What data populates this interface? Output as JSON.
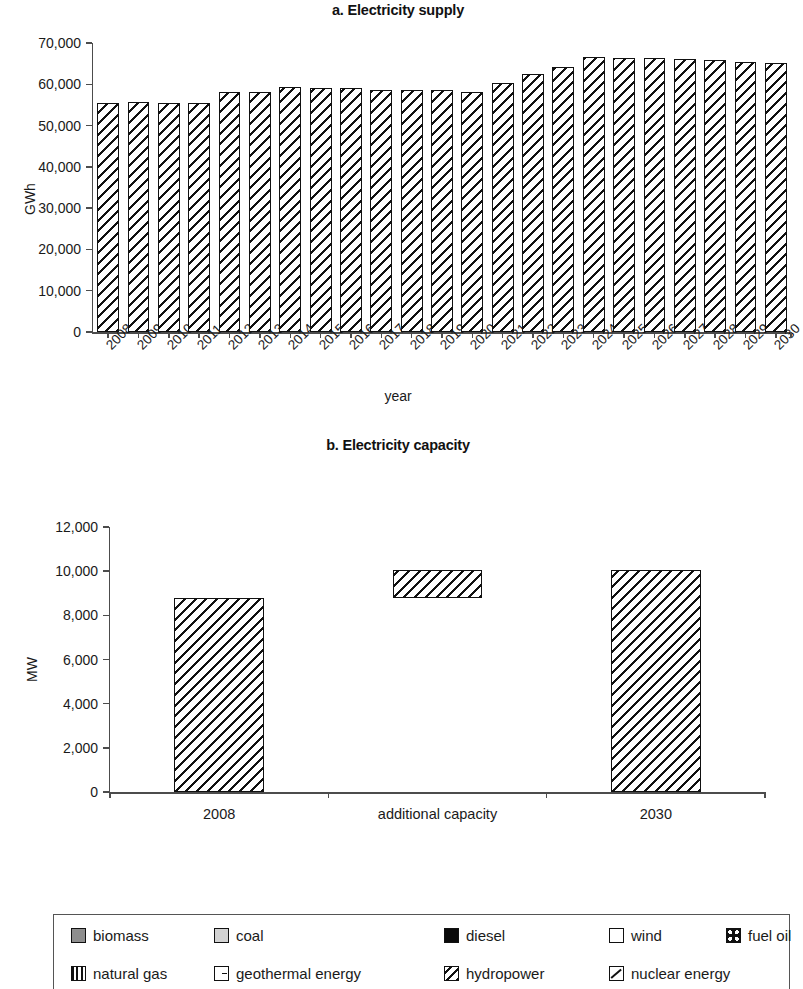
{
  "chart_data": [
    {
      "type": "bar",
      "title": "a. Electricity supply",
      "xlabel": "year",
      "ylabel": "GWh",
      "ylim": [
        0,
        70000
      ],
      "ytick_labels": [
        "0",
        "10,000",
        "20,000",
        "30,000",
        "40,000",
        "50,000",
        "60,000",
        "70,000"
      ],
      "ytick_values": [
        0,
        10000,
        20000,
        30000,
        40000,
        50000,
        60000,
        70000
      ],
      "grid": false,
      "legend_position": "bottom",
      "categories": [
        "2008",
        "2009",
        "2010",
        "2011",
        "2012",
        "2013",
        "2014",
        "2015",
        "2016",
        "2017",
        "2018",
        "2019",
        "2020",
        "2021",
        "2022",
        "2023",
        "2024",
        "2025",
        "2026",
        "2027",
        "2028",
        "2029",
        "2030"
      ],
      "values": [
        55500,
        55700,
        55400,
        55400,
        58100,
        58100,
        59300,
        59000,
        59000,
        58700,
        58500,
        58500,
        58200,
        60300,
        62400,
        64200,
        66500,
        66300,
        66300,
        66100,
        65900,
        65500,
        65200
      ],
      "series_name": "hydropower"
    },
    {
      "type": "bar",
      "title": "b. Electricity capacity",
      "xlabel": "",
      "ylabel": "MW",
      "ylim": [
        0,
        12000
      ],
      "ytick_labels": [
        "0",
        "2,000",
        "4,000",
        "6,000",
        "8,000",
        "10,000",
        "12,000"
      ],
      "ytick_values": [
        0,
        2000,
        4000,
        6000,
        8000,
        10000,
        12000
      ],
      "grid": false,
      "legend_position": "bottom",
      "categories": [
        "2008",
        "additional capacity",
        "2030"
      ],
      "values": [
        8800,
        1250,
        10050
      ],
      "bases": [
        0,
        8800,
        0
      ],
      "series_name": "hydropower"
    }
  ],
  "legend": {
    "rows": [
      [
        {
          "label": "biomass",
          "pattern": "solid-dark-gray",
          "color": "#8e8e8e"
        },
        {
          "label": "coal",
          "pattern": "solid-light-gray",
          "color": "#d2d2d2"
        },
        {
          "label": "diesel",
          "pattern": "solid-black",
          "color": "#0a0a0a"
        },
        {
          "label": "wind",
          "pattern": "white",
          "color": "#ffffff"
        },
        {
          "label": "fuel oil",
          "pattern": "checkered-dots",
          "color": "#111111"
        }
      ],
      [
        {
          "label": "natural gas",
          "pattern": "vertical-bars",
          "color": "#111111"
        },
        {
          "label": "geothermal energy",
          "pattern": "small-dash",
          "color": "#111111"
        },
        {
          "label": "hydropower",
          "pattern": "diagonal-hatch",
          "color": "#111111"
        },
        {
          "label": "nuclear energy",
          "pattern": "thin-diagonal-line",
          "color": "#111111"
        }
      ]
    ]
  }
}
